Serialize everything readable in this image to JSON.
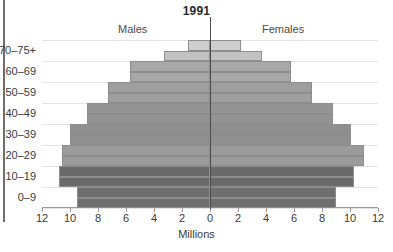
{
  "chart_data": {
    "type": "bar",
    "title": "1991",
    "xlabel": "Millions",
    "ylabel": "",
    "orientation": "population-pyramid",
    "xlim": [
      -12,
      12
    ],
    "grid": true,
    "legend_position": "top",
    "left_series_label": "Males",
    "right_series_label": "Females",
    "axis_tick_labels": [
      "12",
      "10",
      "8",
      "6",
      "4",
      "2",
      "0",
      "2",
      "4",
      "6",
      "8",
      "10",
      "12"
    ],
    "axis_tick_values": [
      -12,
      -10,
      -8,
      -6,
      -4,
      -2,
      0,
      2,
      4,
      6,
      8,
      10,
      12
    ],
    "categories": [
      "0-4",
      "5-9",
      "10-14",
      "15-19",
      "20-24",
      "25-29",
      "30-34",
      "35-39",
      "40-44",
      "45-49",
      "50-54",
      "55-59",
      "60-64",
      "65-69",
      "70-74",
      "75+"
    ],
    "visible_category_labels": [
      "0–9",
      "10–19",
      "20–29",
      "30–39",
      "40–49",
      "50–59",
      "60–69",
      "70–75+"
    ],
    "series": [
      {
        "name": "Males",
        "values": [
          9.5,
          9.5,
          10.8,
          10.8,
          10.6,
          10.6,
          10.0,
          10.0,
          8.8,
          8.8,
          7.3,
          7.3,
          5.7,
          5.7,
          3.3,
          1.6
        ]
      },
      {
        "name": "Females",
        "values": [
          9.0,
          9.0,
          10.3,
          10.3,
          11.0,
          11.0,
          10.1,
          10.1,
          8.8,
          8.8,
          7.3,
          7.3,
          5.8,
          5.8,
          3.7,
          2.2
        ]
      }
    ],
    "bar_colors": [
      "#6f6f6f",
      "#6f6f6f",
      "#6a6a6a",
      "#6a6a6a",
      "#9b9b9b",
      "#9b9b9b",
      "#8f8f8f",
      "#8f8f8f",
      "#949494",
      "#949494",
      "#9e9e9e",
      "#9e9e9e",
      "#a8a8a8",
      "#a8a8a8",
      "#c2c2c2",
      "#cfcfcf"
    ],
    "colors": {
      "grid": "#e3e3e3",
      "axis": "#9a9a9a",
      "zero_line": "#4d4d4d",
      "bar_outline": "#8d8d8d",
      "text": "#3a3a3a",
      "title": "#2b2b2b"
    }
  }
}
